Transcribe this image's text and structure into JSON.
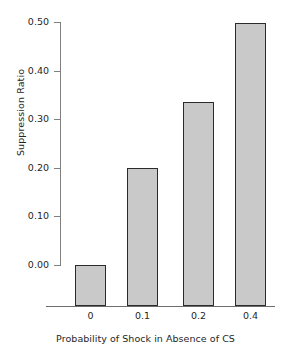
{
  "chart_data": {
    "type": "bar",
    "title": "",
    "xlabel": "Probability of Shock in Absence of CS",
    "ylabel": "Suppression Ratio",
    "categories": [
      "0",
      "0.1",
      "0.2",
      "0.4"
    ],
    "values": [
      0.0,
      0.2,
      0.335,
      0.497
    ],
    "ylim": [
      0.0,
      0.5
    ],
    "yticks": [
      0.0,
      0.1,
      0.2,
      0.3,
      0.4,
      0.5
    ],
    "ytick_labels": [
      "0.00",
      "0.10",
      "0.20",
      "0.30",
      "0.40",
      "0.50"
    ],
    "xtick_labels": [
      "0",
      "0.1",
      "0.2",
      "0.4"
    ],
    "grid": false,
    "legend": null,
    "bar_fill_color": "#c9c9c9",
    "bar_edge_color": "#2b2b2b",
    "axis_color": "#7a7a7a",
    "background_color": "#ffffff"
  }
}
